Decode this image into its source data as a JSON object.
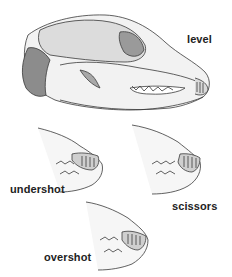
{
  "figure": {
    "labels": {
      "level": "level",
      "undershot": "undershot",
      "scissors": "scissors",
      "overshot": "overshot"
    },
    "colors": {
      "line": "#3a3a3a",
      "shade": "#bdbdbd",
      "light": "#e6e6e6",
      "text": "#222222"
    }
  }
}
